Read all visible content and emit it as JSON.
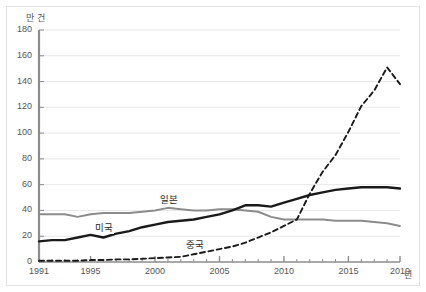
{
  "chart_data": {
    "type": "line",
    "title": "",
    "subtitle": "",
    "xlabel": "년",
    "ylabel": "만 건",
    "xlim": [
      1991,
      2019
    ],
    "ylim": [
      0,
      180
    ],
    "ytick_step": 20,
    "yticks": [
      0,
      20,
      40,
      60,
      80,
      100,
      120,
      140,
      160,
      180
    ],
    "xticks_major": [
      1991,
      1995,
      2000,
      2005,
      2010,
      2015,
      2019
    ],
    "xticks_minor_every": 1,
    "grid": "horizontal",
    "legend": "inline-annotations",
    "x": [
      1991,
      1992,
      1993,
      1994,
      1995,
      1996,
      1997,
      1998,
      1999,
      2000,
      2001,
      2002,
      2003,
      2004,
      2005,
      2006,
      2007,
      2008,
      2009,
      2010,
      2011,
      2012,
      2013,
      2014,
      2015,
      2016,
      2017,
      2018,
      2019
    ],
    "series": [
      {
        "name": "일본",
        "style": "solid",
        "color": "#8c8c8c",
        "width": 2.0,
        "label_x": 2001,
        "label_y": 49,
        "values": [
          37,
          37,
          37,
          35,
          37,
          38,
          38,
          38,
          39,
          40,
          42,
          41,
          40,
          40,
          41,
          41,
          40,
          39,
          35,
          33,
          33,
          33,
          33,
          32,
          32,
          32,
          31,
          30,
          28
        ]
      },
      {
        "name": "미국",
        "style": "solid",
        "color": "#1a1a1a",
        "width": 2.4,
        "label_x": 1996,
        "label_y": 27,
        "values": [
          16,
          17,
          17,
          19,
          21,
          19,
          22,
          24,
          27,
          29,
          31,
          32,
          33,
          35,
          37,
          40,
          44,
          44,
          43,
          46,
          49,
          52,
          54,
          56,
          57,
          58,
          58,
          58,
          57
        ]
      },
      {
        "name": "중국",
        "style": "dashed",
        "color": "#1a1a1a",
        "width": 1.9,
        "label_x": 2003,
        "label_y": 14,
        "values": [
          1,
          1,
          1,
          1,
          1.5,
          1.5,
          2,
          2,
          2.5,
          3,
          3.5,
          4,
          6,
          8,
          10,
          12,
          15,
          19,
          23,
          28,
          33,
          53,
          70,
          83,
          101,
          121,
          133,
          151,
          138
        ]
      }
    ]
  },
  "axes": {
    "y_title": "만 건",
    "x_title": "년",
    "y_tick_labels": [
      "0",
      "20",
      "40",
      "60",
      "80",
      "100",
      "120",
      "140",
      "160",
      "180"
    ],
    "x_tick_labels": [
      "1991",
      "1995",
      "2000",
      "2005",
      "2010",
      "2015",
      "2019"
    ]
  },
  "colors": {
    "axis": "#8c8c8c",
    "grid": "#e8e8e8",
    "frame": "#e3e3e3",
    "text": "#555555",
    "series_black": "#1a1a1a",
    "series_gray": "#8c8c8c"
  }
}
